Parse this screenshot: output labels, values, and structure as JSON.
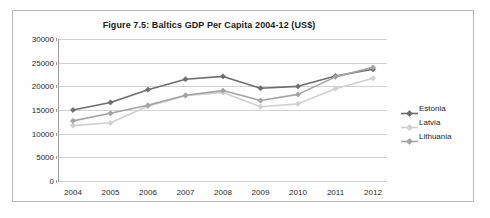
{
  "figure": {
    "title": "Figure 7.5: Baltics GDP Per Capita 2004-12 (US$)",
    "border_color": "#b9b9b9",
    "background": "#ffffff"
  },
  "axes": {
    "y_ticks": [
      "0",
      "5000",
      "10000",
      "15000",
      "20000",
      "25000",
      "30000"
    ],
    "x_ticks": [
      "2004",
      "2005",
      "2006",
      "2007",
      "2008",
      "2009",
      "2010",
      "2011",
      "2012"
    ],
    "axis_color": "#9a9a9a",
    "gridline_color": "#d2d2d2"
  },
  "legend": {
    "position": "right",
    "items": [
      {
        "label": "Estonia",
        "color": "#6e6e6e",
        "marker": "diamond-marker"
      },
      {
        "label": "Latvia",
        "color": "#d0d0d0",
        "marker": "diamond-marker"
      },
      {
        "label": "Lithuania",
        "color": "#a3a3a3",
        "marker": "diamond-marker"
      }
    ]
  },
  "chart_data": {
    "type": "line",
    "title": "Figure 7.5: Baltics GDP Per Capita 2004-12 (US$)",
    "xlabel": "",
    "ylabel": "",
    "categories": [
      "2004",
      "2005",
      "2006",
      "2007",
      "2008",
      "2009",
      "2010",
      "2011",
      "2012"
    ],
    "ylim": [
      0,
      30000
    ],
    "ytick_step": 5000,
    "grid": true,
    "legend_position": "right",
    "series": [
      {
        "name": "Estonia",
        "color": "#6e6e6e",
        "values": [
          15000,
          16600,
          19300,
          21500,
          22100,
          19600,
          20000,
          22200,
          23600
        ]
      },
      {
        "name": "Latvia",
        "color": "#d0d0d0",
        "values": [
          11700,
          12300,
          15800,
          18000,
          18700,
          15700,
          16300,
          19500,
          21700
        ]
      },
      {
        "name": "Lithuania",
        "color": "#a3a3a3",
        "values": [
          12700,
          14300,
          16000,
          18100,
          19100,
          17000,
          18300,
          22000,
          24000
        ]
      }
    ]
  }
}
